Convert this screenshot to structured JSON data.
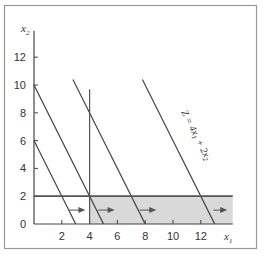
{
  "chart_data": {
    "type": "line",
    "title": "",
    "xlabel": "x1",
    "ylabel": "x2",
    "xlim": [
      0,
      14.3
    ],
    "ylim": [
      0,
      13.9
    ],
    "grid": false,
    "x_ticks": [
      2,
      4,
      6,
      8,
      10,
      12
    ],
    "y_ticks": [
      0,
      2,
      4,
      6,
      8,
      10,
      12
    ],
    "x_tick_labels": [
      "2",
      "4",
      "6",
      "8",
      "10",
      "12"
    ],
    "y_tick_labels": [
      "0",
      "2",
      "4",
      "6",
      "8",
      "10",
      "12"
    ],
    "series": [
      {
        "name": "objective-line-1",
        "points": [
          [
            0,
            6
          ],
          [
            3,
            0
          ]
        ]
      },
      {
        "name": "objective-line-2",
        "points": [
          [
            0,
            10
          ],
          [
            5,
            0
          ]
        ]
      },
      {
        "name": "objective-line-3",
        "points": [
          [
            2.8,
            10.4
          ],
          [
            8,
            0
          ]
        ]
      },
      {
        "name": "objective-line-4",
        "points": [
          [
            7.8,
            10.4
          ],
          [
            13,
            0
          ]
        ],
        "label": "Z = 4x1 + 2x2"
      },
      {
        "name": "constraint-x1-eq-4",
        "points": [
          [
            4,
            0
          ],
          [
            4,
            9.7
          ]
        ]
      },
      {
        "name": "constraint-x2-eq-2",
        "points": [
          [
            0,
            2
          ],
          [
            14.3,
            2
          ]
        ]
      }
    ],
    "shaded_region": {
      "x": [
        4,
        14.3
      ],
      "y": [
        0,
        2
      ],
      "color": "#d9d9d9"
    },
    "arrows": [
      {
        "from": [
          2.5,
          1
        ],
        "to": [
          3.7,
          1
        ]
      },
      {
        "from": [
          4.6,
          1
        ],
        "to": [
          5.8,
          1
        ]
      },
      {
        "from": [
          7.6,
          1
        ],
        "to": [
          8.8,
          1
        ]
      },
      {
        "from": [
          12.9,
          1
        ],
        "to": [
          13.9,
          1
        ]
      }
    ],
    "annotations": [
      {
        "text": "Z = 4x1 + 2x2",
        "along": "objective-line-4"
      }
    ]
  },
  "labels": {
    "x_axis": "x",
    "x_axis_sub": "1",
    "y_axis": "x",
    "y_axis_sub": "2",
    "z_line": "Z = 4x",
    "z_line_sub1": "1",
    "z_line_mid": " + 2x",
    "z_line_sub2": "2"
  },
  "colors": {
    "line": "#444444",
    "shade": "#d9d9d9",
    "frame": "#888888",
    "constraint": "#555555"
  }
}
